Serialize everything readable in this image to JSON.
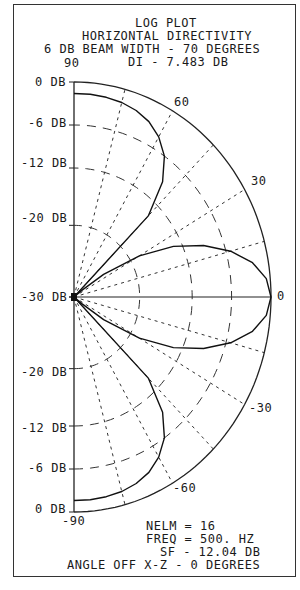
{
  "title": {
    "line1": "LOG PLOT",
    "line2": "HORIZONTAL DIRECTIVITY",
    "line3": "6 DB BEAM WIDTH - 70 DEGREES",
    "line4": "DI - 7.483 DB"
  },
  "angle_labels": {
    "a90": "90",
    "a60": "60",
    "a30": "30",
    "a0": "0",
    "am30": "-30",
    "am60": "-60",
    "am90": "-90"
  },
  "db_labels": {
    "upper": [
      "0 DB",
      "-6 DB",
      "-12 DB",
      "-20 DB"
    ],
    "center": "-30 DB",
    "lower": [
      "-20 DB",
      "-12 DB",
      "-6 DB",
      "0 DB"
    ]
  },
  "footer": {
    "nelm": "NELM = 16",
    "freq": "FREQ = 500. HZ",
    "sf": "SF - 12.04 DB",
    "angle": "ANGLE OFF X-Z - 0 DEGREES"
  },
  "chart_data": {
    "type": "polar-line",
    "subtitle": [
      "6 DB BEAM WIDTH - 70 DEGREES",
      "DI - 7.483 DB"
    ],
    "radial_axis": {
      "unit": "dB",
      "range": [
        -30,
        0
      ],
      "ticks": [
        0,
        -6,
        -12,
        -20,
        -30
      ]
    },
    "angular_axis": {
      "unit": "degrees",
      "range": [
        -90,
        90
      ],
      "labeled_ticks": [
        90,
        60,
        30,
        0,
        -30,
        -60,
        -90
      ],
      "grid_spokes": [
        15,
        30,
        45,
        60,
        75,
        -15,
        -30,
        -45,
        -60,
        -75
      ]
    },
    "grid": true,
    "series": [
      {
        "name": "main lobe",
        "angles": [
          0,
          5,
          10,
          15,
          20,
          25,
          30,
          35,
          38,
          40,
          -5,
          -10,
          -15,
          -20,
          -25,
          -30,
          -35,
          -38,
          -40
        ],
        "db": [
          0,
          -0.6,
          -2.4,
          -5.3,
          -9.0,
          -13.3,
          -18.5,
          -24.5,
          -28.5,
          -30,
          -0.6,
          -2.4,
          -5.3,
          -9.0,
          -13.3,
          -18.5,
          -24.5,
          -28.5,
          -30
        ]
      },
      {
        "name": "side lobe",
        "angles": [
          40,
          45,
          50,
          55,
          60,
          65,
          70,
          75,
          80,
          85,
          90
        ],
        "db": [
          -30,
          -14,
          -9.0,
          -6.0,
          -4.2,
          -3.0,
          -2.3,
          -1.9,
          -1.7,
          -1.6,
          -1.6
        ]
      }
    ],
    "annotations": [
      "NELM = 16",
      "FREQ = 500. HZ",
      "SF - 12.04 DB",
      "ANGLE OFF X-Z - 0 DEGREES"
    ]
  }
}
